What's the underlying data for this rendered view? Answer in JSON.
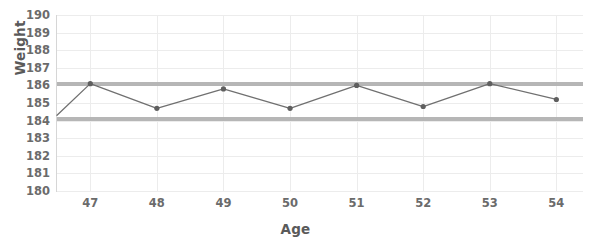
{
  "chart_data": {
    "type": "line",
    "title": "",
    "xlabel": "Age",
    "ylabel": "Weight",
    "x": [
      46.5,
      47,
      48,
      49,
      50,
      51,
      52,
      53,
      54
    ],
    "values": [
      184.3,
      186.1,
      184.7,
      185.8,
      184.7,
      186.0,
      184.8,
      186.1,
      185.2
    ],
    "series": [
      {
        "name": "Weight",
        "values": [
          184.3,
          186.1,
          184.7,
          185.8,
          184.7,
          186.0,
          184.8,
          186.1,
          185.2
        ]
      }
    ],
    "categories": [
      "46.5",
      "47",
      "48",
      "49",
      "50",
      "51",
      "52",
      "53",
      "54"
    ],
    "xlim": [
      46.5,
      54.4
    ],
    "ylim": [
      180,
      190
    ],
    "xticks": [
      47,
      48,
      49,
      50,
      51,
      52,
      53,
      54
    ],
    "xtick_labels": [
      "47",
      "48",
      "49",
      "50",
      "51",
      "52",
      "53",
      "54"
    ],
    "yticks": [
      180,
      181,
      182,
      183,
      184,
      185,
      186,
      187,
      188,
      189,
      190
    ],
    "ytick_labels": [
      "190",
      "189",
      "188",
      "187",
      "186",
      "185",
      "184",
      "183",
      "182",
      "181",
      "180"
    ],
    "grid": true,
    "legend": false,
    "legend_position": "none",
    "reference_lines": [
      {
        "name": "upper-limit",
        "value": 186.1,
        "color": "#b0b0b0"
      },
      {
        "name": "lower-limit",
        "value": 184.1,
        "color": "#b0b0b0"
      }
    ],
    "line_color": "#707070",
    "marker_color": "#5f5f5f",
    "grid_color": "#ececec",
    "axis_color": "#d6d6d6",
    "tick_label_color": "#6b6b6b",
    "axis_title_color": "#5a5a5a",
    "background": "#ffffff"
  }
}
